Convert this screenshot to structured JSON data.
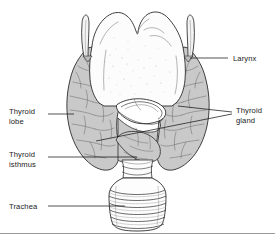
{
  "figure": {
    "background_color": "#ffffff",
    "line_color": "#2b2b2b",
    "gland_fill_color": "#c9c9c9",
    "cartilage_fill_color": "#fbfbfb",
    "text_color": "#1a1a1a"
  },
  "labels": {
    "larynx": {
      "text": "Larynx"
    },
    "thyroid_lobe": {
      "line1": "Thyroid",
      "line2": "lobe"
    },
    "thyroid_gland": {
      "line1": "Thyroid",
      "line2": "gland"
    },
    "thyroid_isthmus": {
      "line1": "Thyroid",
      "line2": "isthmus"
    },
    "trachea": {
      "text": "Trachea"
    }
  },
  "structures": [
    {
      "name": "larynx",
      "description": "thyroid cartilage with superior horns"
    },
    {
      "name": "thyroid-lobe-left",
      "description": "left lateral lobe of thyroid"
    },
    {
      "name": "thyroid-lobe-right",
      "description": "right lateral lobe of thyroid"
    },
    {
      "name": "thyroid-isthmus",
      "description": "connecting band between lobes"
    },
    {
      "name": "cricoid-cartilage",
      "description": "ring cartilage below larynx"
    },
    {
      "name": "trachea",
      "description": "stacked cartilage rings"
    }
  ]
}
